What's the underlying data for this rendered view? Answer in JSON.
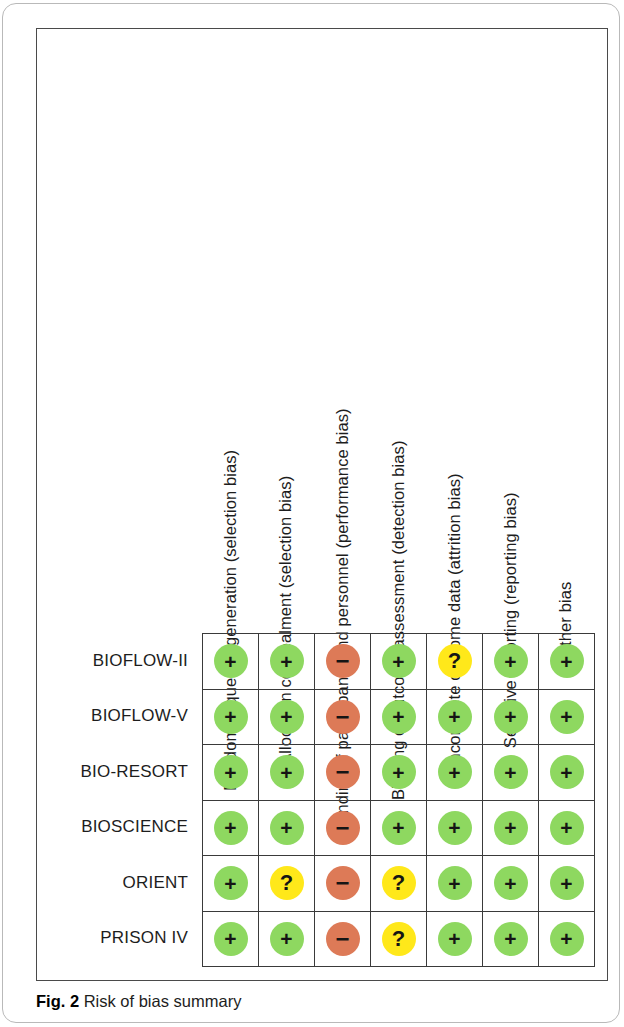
{
  "figure": {
    "caption_label": "Fig. 2",
    "caption_text": "Risk of bias summary"
  },
  "colors": {
    "low_risk": "#8ed860",
    "high_risk": "#dd7a57",
    "unclear_risk": "#ffe81a",
    "grid_line": "#3a3a3a",
    "frame": "#4a4a4a"
  },
  "legend_symbols": {
    "low_risk": "+",
    "high_risk": "−",
    "unclear_risk": "?"
  },
  "chart_data": {
    "type": "heatmap",
    "title": "Risk of bias summary",
    "xlabel": "",
    "ylabel": "",
    "grid": true,
    "legend_position": "none",
    "categories": [
      "Random sequence generation (selection bias)",
      "Allocation concealment (selection bias)",
      "Blinding of participants and personnel (performance bias)",
      "Blinding of outcome assessment (detection bias)",
      "Incomplete outcome data (attrition bias)",
      "Selective reporting (reporting bias)",
      "Other bias"
    ],
    "rows": [
      {
        "study": "BIOFLOW-II",
        "judgements": [
          "low",
          "low",
          "high",
          "low",
          "unclear",
          "low",
          "low"
        ],
        "symbols": [
          "+",
          "+",
          "−",
          "+",
          "?",
          "+",
          "+"
        ]
      },
      {
        "study": "BIOFLOW-V",
        "judgements": [
          "low",
          "low",
          "high",
          "low",
          "low",
          "low",
          "low"
        ],
        "symbols": [
          "+",
          "+",
          "−",
          "+",
          "+",
          "+",
          "+"
        ]
      },
      {
        "study": "BIO-RESORT",
        "judgements": [
          "low",
          "low",
          "high",
          "low",
          "low",
          "low",
          "low"
        ],
        "symbols": [
          "+",
          "+",
          "−",
          "+",
          "+",
          "+",
          "+"
        ]
      },
      {
        "study": "BIOSCIENCE",
        "judgements": [
          "low",
          "low",
          "high",
          "low",
          "low",
          "low",
          "low"
        ],
        "symbols": [
          "+",
          "+",
          "−",
          "+",
          "+",
          "+",
          "+"
        ]
      },
      {
        "study": "ORIENT",
        "judgements": [
          "low",
          "unclear",
          "high",
          "unclear",
          "low",
          "low",
          "low"
        ],
        "symbols": [
          "+",
          "?",
          "−",
          "?",
          "+",
          "+",
          "+"
        ]
      },
      {
        "study": "PRISON IV",
        "judgements": [
          "low",
          "low",
          "high",
          "unclear",
          "low",
          "low",
          "low"
        ],
        "symbols": [
          "+",
          "+",
          "−",
          "?",
          "+",
          "+",
          "+"
        ]
      }
    ]
  }
}
